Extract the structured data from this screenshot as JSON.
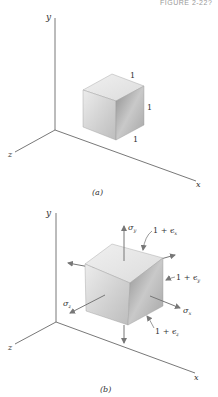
{
  "figure_caption": "FIGURE 2-22?",
  "panels": [
    {
      "id": "a",
      "caption": "(a)",
      "axes": {
        "x": "x",
        "y": "y",
        "z": "z"
      },
      "cube": {
        "edge_labels": [
          "1",
          "1",
          "1"
        ]
      }
    },
    {
      "id": "b",
      "caption": "(b)",
      "axes": {
        "x": "x",
        "y": "y",
        "z": "z"
      },
      "stresses": {
        "sigma_x": "σx",
        "sigma_y": "σy",
        "sigma_z": "σz"
      },
      "edge_labels": {
        "ex": "1 + ϵx",
        "ey": "1 + ϵy",
        "ez": "1 + ϵz"
      },
      "stress_sym": "σ",
      "one_plus": "1 + ϵ",
      "sub_x": "x",
      "sub_y": "y",
      "sub_z": "z"
    }
  ],
  "colors": {
    "axis": "#555555",
    "cube_top": "#e4e4e4",
    "cube_front": "#d0d0d0",
    "cube_side": "#a8a8a8",
    "arrow": "#777777"
  }
}
